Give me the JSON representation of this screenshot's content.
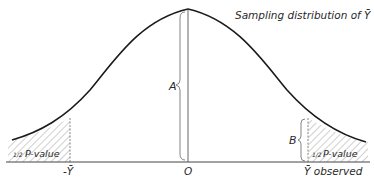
{
  "title": "Sampling distribution of Ȳ",
  "labels": {
    "a": "A",
    "b": "B",
    "zero": "O",
    "neg_ybar": "-Ȳ",
    "ybar_observed": "Ȳ observed",
    "half_left_frac": "1/2",
    "half_left_text": "P-value",
    "half_right_frac": "1/2",
    "half_right_text": "P-value"
  },
  "colors": {
    "curve": "#1a1a1a",
    "lines": "#555555",
    "hatch": "#777777",
    "text": "#2a2a2a"
  }
}
